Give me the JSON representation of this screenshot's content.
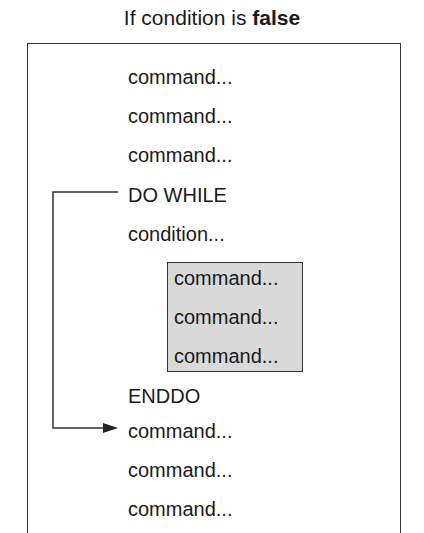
{
  "title": {
    "prefix": "If condition is ",
    "emphasis": "false"
  },
  "lines_before": [
    "command...",
    "command...",
    "command..."
  ],
  "loop": {
    "start": "DO WHILE",
    "condition": "condition...",
    "body": [
      "command...",
      "command...",
      "command..."
    ],
    "end": "ENDDO"
  },
  "lines_after": [
    "command...",
    "command...",
    "command..."
  ],
  "colors": {
    "loop_body_fill": "#d9d9d9",
    "stroke": "#333333"
  }
}
